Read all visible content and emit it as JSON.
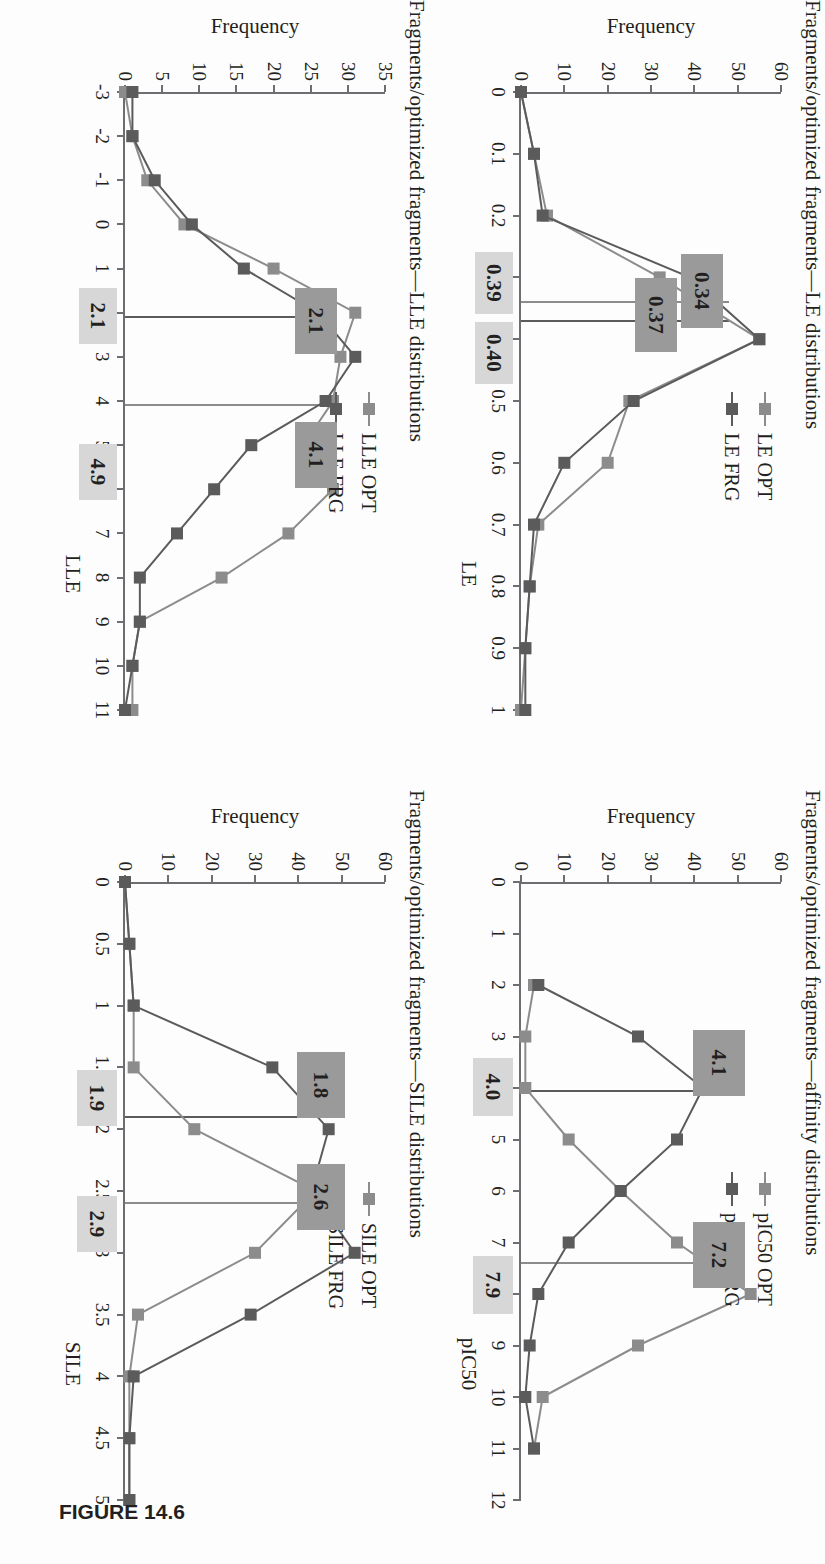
{
  "figure": {
    "caption": "FIGURE 14.6",
    "colors": {
      "opt_series": "#8c8c8c",
      "frg_series": "#5b5b5b",
      "dark_callout": "#9a9a9a",
      "light_callout": "#d7d7d7",
      "axis": "#6d6e71",
      "text": "#231f20"
    }
  },
  "panels": {
    "le": {
      "title": "Fragments/optimized fragments—LE distributions",
      "legend": [
        {
          "label": "LE OPT",
          "color": "#8c8c8c"
        },
        {
          "label": "LE FRG",
          "color": "#5b5b5b"
        }
      ],
      "callouts": [
        {
          "text": "0.34",
          "style": "dark"
        },
        {
          "text": "0.37",
          "style": "dark"
        },
        {
          "text": "0.40",
          "style": "light"
        },
        {
          "text": "0.39",
          "style": "light"
        }
      ]
    },
    "lle": {
      "title": "Fragments/optimized fragments—LLE distributions",
      "legend": [
        {
          "label": "LLE OPT",
          "color": "#8c8c8c"
        },
        {
          "label": "LLE FRG",
          "color": "#5b5b5b"
        }
      ],
      "callouts": [
        {
          "text": "4.1",
          "style": "dark"
        },
        {
          "text": "2.1",
          "style": "dark"
        },
        {
          "text": "4.9",
          "style": "light"
        },
        {
          "text": "2.1",
          "style": "light"
        }
      ]
    },
    "pic50": {
      "title": "Fragments/optimized fragments—affinity distributions",
      "legend": [
        {
          "label": "pIC50 OPT",
          "color": "#8c8c8c"
        },
        {
          "label": "pIC50 FRG",
          "color": "#5b5b5b"
        }
      ],
      "callouts": [
        {
          "text": "7.2",
          "style": "dark"
        },
        {
          "text": "4.1",
          "style": "dark"
        },
        {
          "text": "7.9",
          "style": "light"
        },
        {
          "text": "4.0",
          "style": "light"
        }
      ]
    },
    "sile": {
      "title": "Fragments/optimized fragments—SILE distributions",
      "legend": [
        {
          "label": "SILE OPT",
          "color": "#8c8c8c"
        },
        {
          "label": "SILE FRG",
          "color": "#5b5b5b"
        }
      ],
      "callouts": [
        {
          "text": "2.6",
          "style": "dark"
        },
        {
          "text": "1.8",
          "style": "dark"
        },
        {
          "text": "2.9",
          "style": "light"
        },
        {
          "text": "1.9",
          "style": "light"
        }
      ]
    }
  },
  "chart_data": [
    {
      "id": "le",
      "type": "line",
      "title": "Fragments/optimized fragments—LE distributions",
      "xlabel": "LE",
      "ylabel": "Frequency",
      "xlim": [
        0,
        1
      ],
      "ylim": [
        0,
        60
      ],
      "xticks": [
        "0",
        "0.1",
        "0.2",
        "0.3",
        "0.4",
        "0.5",
        "0.6",
        "0.7",
        "0.8",
        "0.9",
        "1"
      ],
      "yticks": [
        "0",
        "10",
        "20",
        "30",
        "40",
        "50",
        "60"
      ],
      "grid": false,
      "legend_position": "top-left-inside",
      "x": [
        0,
        0.1,
        0.2,
        0.3,
        0.4,
        0.5,
        0.6,
        0.7,
        0.8,
        0.9,
        1
      ],
      "series": [
        {
          "name": "LE OPT",
          "color": "#8c8c8c",
          "values": [
            0,
            3,
            6,
            32,
            55,
            25,
            20,
            4,
            2,
            1,
            0
          ]
        },
        {
          "name": "LE FRG",
          "color": "#5b5b5b",
          "values": [
            0,
            3,
            5,
            39,
            55,
            26,
            10,
            3,
            2,
            1,
            1
          ]
        }
      ],
      "annotations": [
        {
          "text": "0.34",
          "value": 0.34,
          "series": "LE OPT",
          "style": "dark"
        },
        {
          "text": "0.37",
          "value": 0.37,
          "series": "LE FRG",
          "style": "dark"
        },
        {
          "text": "0.40",
          "value": 0.4,
          "style": "light"
        },
        {
          "text": "0.39",
          "value": 0.39,
          "style": "light"
        }
      ]
    },
    {
      "id": "lle",
      "type": "line",
      "title": "Fragments/optimized fragments—LLE distributions",
      "xlabel": "LLE",
      "ylabel": "Frequency",
      "xlim": [
        -3,
        11
      ],
      "ylim": [
        0,
        35
      ],
      "xticks": [
        "-3",
        "-2",
        "-1",
        "0",
        "1",
        "2",
        "3",
        "4",
        "5",
        "6",
        "7",
        "8",
        "9",
        "10",
        "11"
      ],
      "yticks": [
        "0",
        "5",
        "10",
        "15",
        "20",
        "25",
        "30",
        "35"
      ],
      "grid": false,
      "legend_position": "top-left-inside",
      "x": [
        -3,
        -2,
        -1,
        0,
        1,
        2,
        3,
        4,
        5,
        6,
        7,
        8,
        9,
        10,
        11
      ],
      "series": [
        {
          "name": "LLE OPT",
          "color": "#8c8c8c",
          "values": [
            0,
            1,
            3,
            8,
            20,
            31,
            29,
            28,
            24,
            28,
            22,
            13,
            2,
            1,
            1
          ]
        },
        {
          "name": "LLE FRG",
          "color": "#5b5b5b",
          "values": [
            1,
            1,
            4,
            9,
            16,
            26,
            31,
            27,
            17,
            12,
            7,
            2,
            2,
            1,
            0
          ]
        }
      ],
      "annotations": [
        {
          "text": "4.1",
          "value": 4.1,
          "style": "dark"
        },
        {
          "text": "2.1",
          "value": 2.1,
          "style": "dark"
        },
        {
          "text": "4.9",
          "value": 4.9,
          "style": "light"
        },
        {
          "text": "2.1",
          "value": 2.1,
          "style": "light"
        }
      ]
    },
    {
      "id": "pic50",
      "type": "line",
      "title": "Fragments/optimized fragments—affinity distributions",
      "xlabel": "pIC50",
      "ylabel": "Frequency",
      "xlim": [
        0,
        12
      ],
      "ylim": [
        0,
        60
      ],
      "xticks": [
        "0",
        "1",
        "2",
        "3",
        "4",
        "5",
        "6",
        "7",
        "8",
        "9",
        "10",
        "11",
        "12"
      ],
      "yticks": [
        "0",
        "10",
        "20",
        "30",
        "40",
        "50",
        "60"
      ],
      "grid": false,
      "legend_position": "top-left-inside",
      "x": [
        2,
        3,
        4,
        5,
        6,
        7,
        8,
        9,
        10,
        11
      ],
      "series": [
        {
          "name": "pIC50 OPT",
          "color": "#8c8c8c",
          "values": [
            3,
            1,
            1,
            11,
            23,
            36,
            53,
            27,
            5,
            3
          ]
        },
        {
          "name": "pIC50 FRG",
          "color": "#5b5b5b",
          "values": [
            4,
            27,
            42,
            36,
            23,
            11,
            4,
            2,
            1,
            3
          ]
        }
      ],
      "annotations": [
        {
          "text": "7.2",
          "value": 7.2,
          "style": "dark"
        },
        {
          "text": "4.1",
          "value": 4.1,
          "style": "dark"
        },
        {
          "text": "7.9",
          "value": 7.9,
          "style": "light"
        },
        {
          "text": "4.0",
          "value": 4.0,
          "style": "light"
        }
      ]
    },
    {
      "id": "sile",
      "type": "line",
      "title": "Fragments/optimized fragments—SILE distributions",
      "xlabel": "SILE",
      "ylabel": "Frequency",
      "xlim": [
        0,
        5
      ],
      "ylim": [
        0,
        60
      ],
      "xticks": [
        "0",
        "0.5",
        "1",
        "1.5",
        "2",
        "2.5",
        "3",
        "3.5",
        "4",
        "4.5",
        "5"
      ],
      "yticks": [
        "0",
        "10",
        "20",
        "30",
        "40",
        "50",
        "60"
      ],
      "grid": false,
      "legend_position": "top-left-inside",
      "x": [
        0,
        0.5,
        1,
        1.5,
        2,
        2.5,
        3,
        3.5,
        4,
        4.5,
        5
      ],
      "series": [
        {
          "name": "SILE OPT",
          "color": "#8c8c8c",
          "values": [
            0,
            1,
            2,
            2,
            16,
            44,
            30,
            3,
            1,
            1,
            1
          ]
        },
        {
          "name": "SILE FRG",
          "color": "#5b5b5b",
          "values": [
            0,
            1,
            2,
            34,
            47,
            43,
            53,
            29,
            2,
            1,
            1
          ]
        }
      ],
      "annotations": [
        {
          "text": "2.6",
          "value": 2.6,
          "style": "dark"
        },
        {
          "text": "1.8",
          "value": 1.8,
          "style": "dark"
        },
        {
          "text": "2.9",
          "value": 2.9,
          "style": "light"
        },
        {
          "text": "1.9",
          "value": 1.9,
          "style": "light"
        }
      ]
    }
  ]
}
